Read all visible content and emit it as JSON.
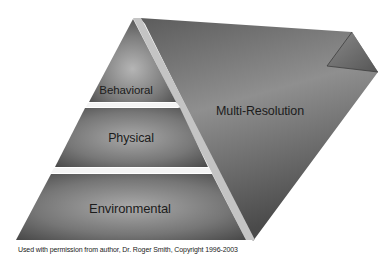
{
  "diagram": {
    "type": "pyramid-with-side-panel",
    "layers": [
      {
        "id": "behavioral",
        "label": "Behavioral"
      },
      {
        "id": "physical",
        "label": "Physical"
      },
      {
        "id": "environmental",
        "label": "Environmental"
      }
    ],
    "side_panel": {
      "label": "Multi-Resolution"
    },
    "caption": "Used with permission from author, Dr. Roger Smith, Copyright 1996-2003",
    "colors": {
      "background": "#ffffff",
      "shape_dark": "#4a4a4a",
      "shape_mid": "#7a7a7a",
      "shape_light": "#b8b8b8",
      "bevel": "#c8c8c8",
      "text": "#1c1c1c"
    }
  }
}
